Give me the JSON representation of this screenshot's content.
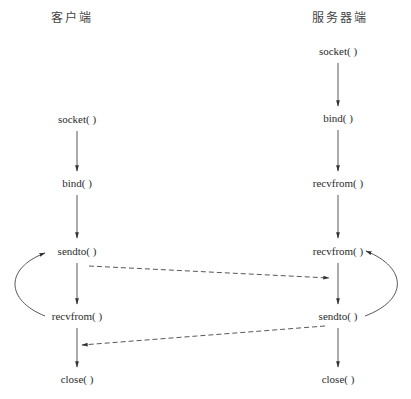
{
  "diagram": {
    "type": "udp-socket-flow",
    "colors": {
      "line": "#333333",
      "text": "#2b2b2b",
      "background": "#ffffff"
    },
    "columns": {
      "client": {
        "title": "客户端",
        "steps": [
          "socket( )",
          "bind( )",
          "sendto( )",
          "recvfrom( )",
          "close( )"
        ]
      },
      "server": {
        "title": "服务器端",
        "steps": [
          "socket( )",
          "bind( )",
          "recvfrom( )",
          "recvfrom( )",
          "sendto( )",
          "close( )"
        ]
      }
    },
    "edges": [
      {
        "from": "client.socket",
        "to": "client.bind",
        "style": "solid"
      },
      {
        "from": "client.bind",
        "to": "client.sendto",
        "style": "solid"
      },
      {
        "from": "client.sendto",
        "to": "client.recvfrom",
        "style": "solid"
      },
      {
        "from": "client.recvfrom",
        "to": "client.close",
        "style": "solid"
      },
      {
        "from": "client.recvfrom",
        "to": "client.sendto",
        "style": "curved-loop"
      },
      {
        "from": "server.socket",
        "to": "server.bind",
        "style": "solid"
      },
      {
        "from": "server.bind",
        "to": "server.recvfrom",
        "style": "solid"
      },
      {
        "from": "server.recvfrom",
        "to": "server.recvfrom2",
        "style": "solid"
      },
      {
        "from": "server.recvfrom2",
        "to": "server.sendto",
        "style": "solid"
      },
      {
        "from": "server.sendto",
        "to": "server.close",
        "style": "solid"
      },
      {
        "from": "server.sendto",
        "to": "server.recvfrom2",
        "style": "curved-loop"
      },
      {
        "from": "client.sendto",
        "to": "server.recvfrom2",
        "style": "dashed"
      },
      {
        "from": "server.sendto",
        "to": "client.close",
        "style": "dashed"
      }
    ]
  }
}
